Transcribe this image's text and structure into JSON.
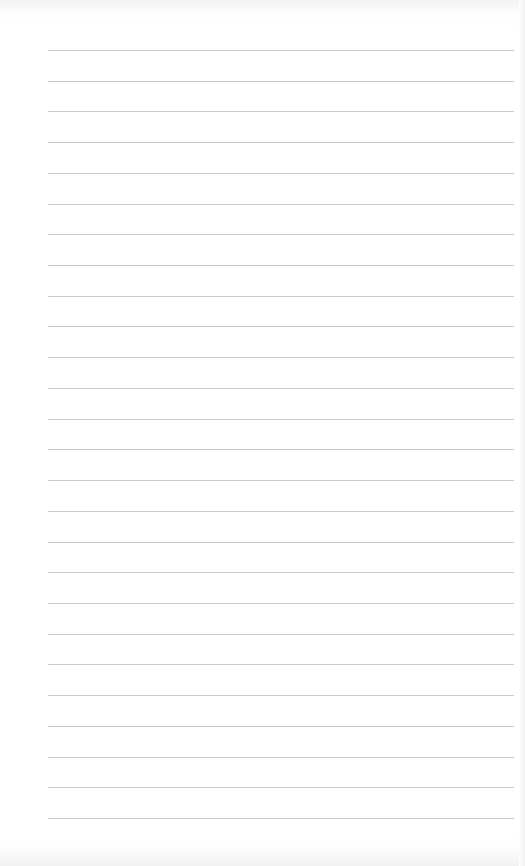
{
  "paper": {
    "type": "lined-paper",
    "background_color": "#ffffff",
    "line_color": "#c9c9c9",
    "line_count": 26,
    "first_line_y": 50,
    "last_line_y": 818,
    "line_spacing": 30.72,
    "line_left": 48,
    "line_right": 514
  }
}
